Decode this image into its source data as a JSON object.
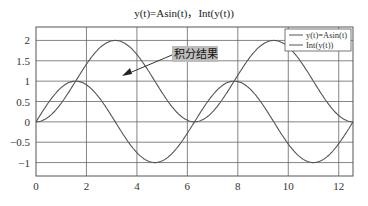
{
  "chart_data": {
    "type": "line",
    "title": "y(t)=Asin(t)，Int(y(t))",
    "xlabel": "",
    "ylabel": "",
    "xlim": [
      0,
      12.566
    ],
    "ylim": [
      -1.33,
      2.33
    ],
    "grid": true,
    "legend_position": "upper right",
    "x_ticks": [
      "0",
      "2",
      "4",
      "6",
      "8",
      "10",
      "12"
    ],
    "y_ticks": [
      "-1",
      "-0.5",
      "0",
      "0.5",
      "1",
      "1.5",
      "2"
    ],
    "series": [
      {
        "name": "y(t)=Asin(t)",
        "function": "sin(t)",
        "color": "#555555",
        "x": [
          0,
          1.5708,
          3.1416,
          4.7124,
          6.2832,
          7.854,
          9.4248,
          10.9956,
          12.566
        ],
        "values": [
          0,
          1,
          0,
          -1,
          0,
          1,
          0,
          -1,
          0
        ]
      },
      {
        "name": "Int(y(t))",
        "function": "1-cos(t)",
        "color": "#555555",
        "x": [
          0,
          1.5708,
          3.1416,
          4.7124,
          6.2832,
          7.854,
          9.4248,
          10.9956,
          12.566
        ],
        "values": [
          0,
          1,
          2,
          1,
          0,
          1,
          2,
          1,
          0
        ]
      }
    ],
    "annotations": [
      {
        "text": "积分结果",
        "points_to": "Int(y(t))",
        "at": [
          4.0,
          1.3
        ]
      }
    ]
  }
}
